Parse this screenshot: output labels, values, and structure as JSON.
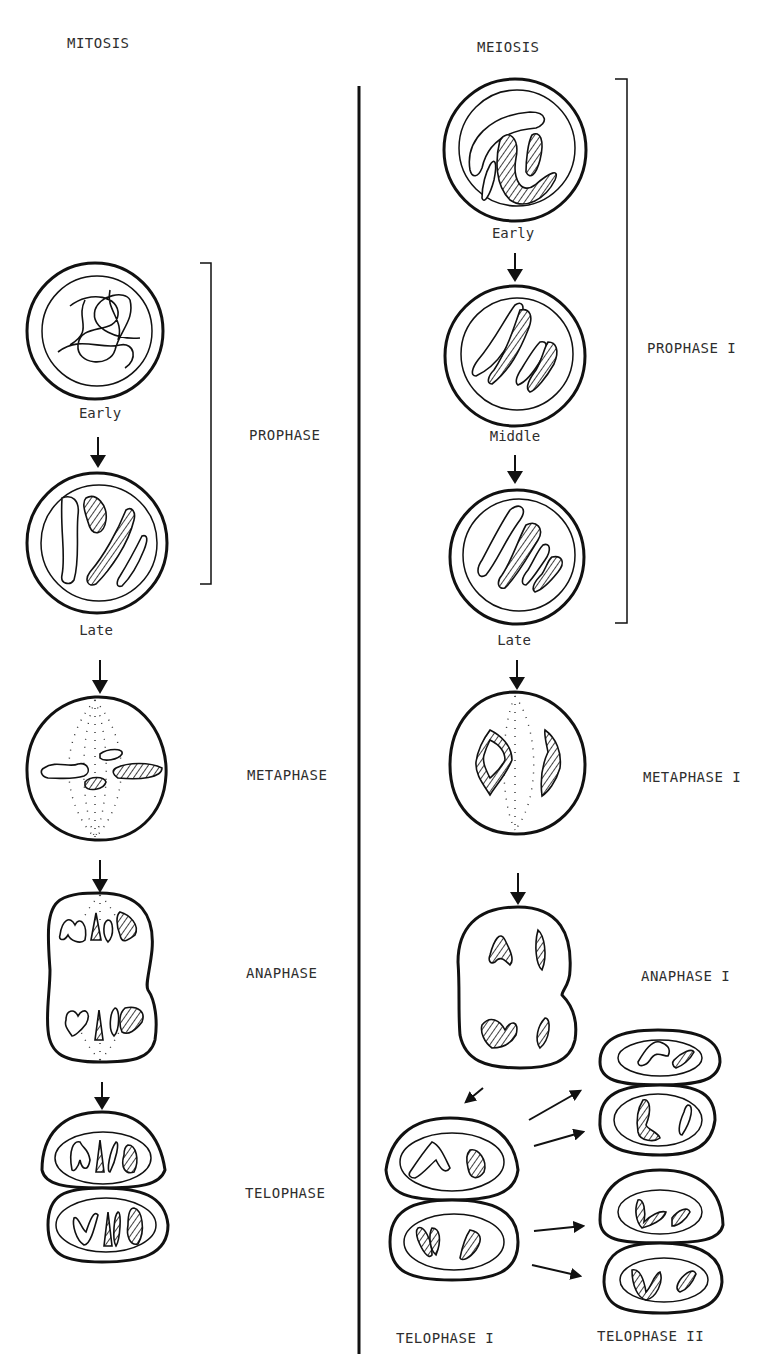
{
  "diagram": {
    "type": "biology-comparison",
    "left_column": {
      "title": "MITOSIS",
      "stages": [
        {
          "name": "PROPHASE",
          "substages": [
            "Early",
            "Late"
          ]
        },
        {
          "name": "METAPHASE"
        },
        {
          "name": "ANAPHASE"
        },
        {
          "name": "TELOPHASE"
        }
      ]
    },
    "right_column": {
      "title": "MEIOSIS",
      "stages": [
        {
          "name": "PROPHASE I",
          "substages": [
            "Early",
            "Middle",
            "Late"
          ]
        },
        {
          "name": "METAPHASE I"
        },
        {
          "name": "ANAPHASE I"
        },
        {
          "name": "TELOPHASE I"
        },
        {
          "name": "TELOPHASE II"
        }
      ]
    },
    "colors": {
      "ink": "#111111",
      "background": "#ffffff"
    }
  },
  "labels": {
    "mitosis_title": "MITOSIS",
    "meiosis_title": "MEIOSIS",
    "prophase": "PROPHASE",
    "metaphase": "METAPHASE",
    "anaphase": "ANAPHASE",
    "telophase": "TELOPHASE",
    "prophase_i": "PROPHASE I",
    "metaphase_i": "METAPHASE I",
    "anaphase_i": "ANAPHASE I",
    "telophase_i": "TELOPHASE I",
    "telophase_ii": "TELOPHASE II",
    "mit_early": "Early",
    "mit_late": "Late",
    "mei_early": "Early",
    "mei_middle": "Middle",
    "mei_late": "Late"
  }
}
